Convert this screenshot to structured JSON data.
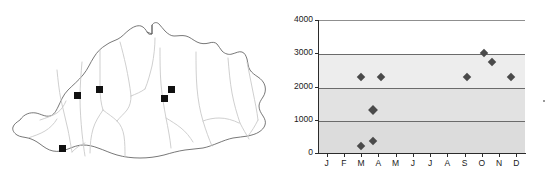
{
  "figure": {
    "panels": [
      "map",
      "chart"
    ]
  },
  "map": {
    "region_name": "Bhutan",
    "outline_color": "#555555",
    "river_color": "#c9c9c9",
    "marker_color": "#111111",
    "marker_label": "study-site",
    "markers": [
      {
        "id": "site-1",
        "x": 78,
        "y": 96,
        "size": 7
      },
      {
        "id": "site-2",
        "x": 99,
        "y": 89,
        "size": 7
      },
      {
        "id": "site-3",
        "x": 164,
        "y": 99,
        "size": 7
      },
      {
        "id": "site-4",
        "x": 171,
        "y": 90,
        "size": 7
      },
      {
        "id": "site-5",
        "x": 62,
        "y": 149,
        "size": 7
      }
    ]
  },
  "chart_data": {
    "type": "scatter",
    "title": "",
    "xlabel": "",
    "ylabel": "",
    "categories": [
      "J",
      "F",
      "M",
      "A",
      "M",
      "J",
      "J",
      "A",
      "S",
      "O",
      "N",
      "D"
    ],
    "ytick_labels": [
      "0",
      "1000",
      "2000",
      "3000",
      "4000"
    ],
    "ytick_values": [
      0,
      1000,
      2000,
      3000,
      4000
    ],
    "ylim": [
      0,
      4000
    ],
    "grid": true,
    "gridlines": [
      1000,
      2000,
      3000,
      4000
    ],
    "legend": "none",
    "marker_shape": "diamond",
    "marker_color": "#4a4a4a",
    "series": [
      {
        "name": "observations",
        "points": [
          {
            "category": "M",
            "x_offset": 0.0,
            "value": 2300
          },
          {
            "category": "M",
            "x_offset": 0.0,
            "value": 220
          },
          {
            "category": "A",
            "x_offset": -0.3,
            "value": 1300
          },
          {
            "category": "A",
            "x_offset": -0.3,
            "value": 370
          },
          {
            "category": "A",
            "x_offset": 0.15,
            "value": 2300
          },
          {
            "category": "S",
            "x_offset": 0.15,
            "value": 2290
          },
          {
            "category": "O",
            "x_offset": 0.15,
            "value": 3000
          },
          {
            "category": "O",
            "x_offset": 0.6,
            "value": 2730
          },
          {
            "category": "D",
            "x_offset": -0.3,
            "value": 2290
          }
        ]
      }
    ],
    "bands": [
      {
        "from": 3000,
        "to": 4000,
        "color": "#ffffff"
      },
      {
        "from": 2000,
        "to": 3000,
        "color": "#ededed"
      },
      {
        "from": 1000,
        "to": 2000,
        "color": "#e2e2e2"
      },
      {
        "from": 0,
        "to": 1000,
        "color": "#dcdcdc"
      }
    ]
  }
}
